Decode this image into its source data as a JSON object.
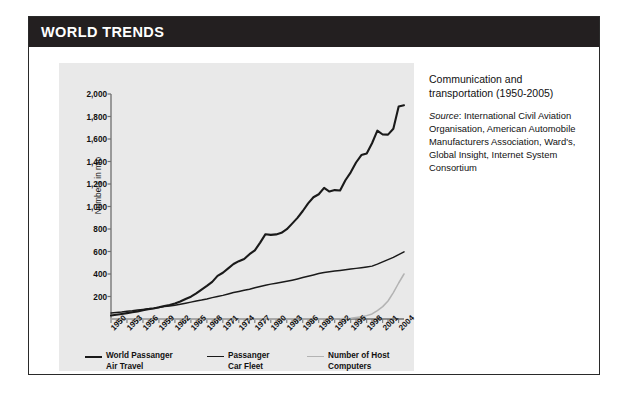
{
  "header": {
    "title": "WORLD TRENDS"
  },
  "caption": {
    "title": "Communication and transportation (1950-2005)",
    "source_label": "Source",
    "source_text": ": International Civil Aviation Organisation, American Automobile Manufacturers Association, Ward's, Global Insight, Internet System Consortium"
  },
  "colors": {
    "header_bg": "#231f20",
    "panel_bg": "#e9e9e9",
    "air_travel": "#1a1a1a",
    "car_fleet": "#1a1a1a",
    "host_computers": "#b3b3b3",
    "axis": "#6f6f6f",
    "text": "#111111"
  },
  "legend": [
    {
      "label": "World Passanger\nAir Travel",
      "color": "#1a1a1a",
      "width": 2.6,
      "left": 0
    },
    {
      "label": "Passanger\nCar Fleet",
      "color": "#1a1a1a",
      "width": 1.6,
      "left": 122
    },
    {
      "label": "Number of Host\nComputers",
      "color": "#b3b3b3",
      "width": 1.6,
      "left": 222
    }
  ],
  "chart_data": {
    "type": "line",
    "title": "Communication and transportation (1950-2005)",
    "xlabel": "",
    "ylabel": "Numbers in mio",
    "ylim": [
      0,
      2000
    ],
    "yticks": [
      200,
      400,
      600,
      800,
      1000,
      1200,
      1400,
      1600,
      1800,
      2000
    ],
    "ytick_labels": [
      "200",
      "400",
      "600",
      "800",
      "1,000",
      "1,200",
      "1,400",
      "1,600",
      "1,800",
      "2,000"
    ],
    "xlim": [
      1950,
      2005
    ],
    "xtick_labels": [
      "1950",
      "1953",
      "1956",
      "1959",
      "1962",
      "1965",
      "1968",
      "1971",
      "1974",
      "1977",
      "1980",
      "1983",
      "1986",
      "1989",
      "1992",
      "1995",
      "1998",
      "2001",
      "2004"
    ],
    "grid": false,
    "legend_position": "bottom",
    "x": [
      1950,
      1951,
      1952,
      1953,
      1954,
      1955,
      1956,
      1957,
      1958,
      1959,
      1960,
      1961,
      1962,
      1963,
      1964,
      1965,
      1966,
      1967,
      1968,
      1969,
      1970,
      1971,
      1972,
      1973,
      1974,
      1975,
      1976,
      1977,
      1978,
      1979,
      1980,
      1981,
      1982,
      1983,
      1984,
      1985,
      1986,
      1987,
      1988,
      1989,
      1990,
      1991,
      1992,
      1993,
      1994,
      1995,
      1996,
      1997,
      1998,
      1999,
      2000,
      2001,
      2002,
      2003,
      2004,
      2005
    ],
    "series": [
      {
        "name": "World Passanger Air Travel",
        "color": "#1a1a1a",
        "values": [
          31,
          38,
          45,
          52,
          60,
          68,
          78,
          88,
          94,
          104,
          116,
          125,
          138,
          155,
          178,
          198,
          228,
          262,
          294,
          330,
          383,
          411,
          450,
          489,
          514,
          534,
          576,
          610,
          679,
          754,
          748,
          752,
          766,
          798,
          848,
          899,
          960,
          1028,
          1082,
          1109,
          1165,
          1133,
          1146,
          1142,
          1233,
          1304,
          1391,
          1457,
          1471,
          1562,
          1674,
          1640,
          1639,
          1691,
          1889,
          1900
        ]
      },
      {
        "name": "Passanger Car Fleet",
        "color": "#1a1a1a",
        "values": [
          53,
          58,
          62,
          68,
          73,
          80,
          85,
          91,
          96,
          103,
          110,
          116,
          123,
          131,
          140,
          150,
          160,
          168,
          178,
          190,
          200,
          210,
          222,
          235,
          245,
          255,
          265,
          277,
          289,
          300,
          310,
          318,
          326,
          335,
          345,
          356,
          368,
          380,
          392,
          404,
          414,
          420,
          426,
          432,
          438,
          444,
          450,
          456,
          463,
          470,
          488,
          508,
          528,
          548,
          572,
          597
        ]
      },
      {
        "name": "Number of Host Computers",
        "color": "#b3b3b3",
        "values": [
          0,
          0,
          0,
          0,
          0,
          0,
          0,
          0,
          0,
          0,
          0,
          0,
          0,
          0,
          0,
          0,
          0,
          0,
          0,
          0,
          0,
          0,
          0,
          0,
          0,
          0,
          0,
          0,
          0,
          0,
          0,
          0,
          0,
          0,
          0,
          0,
          0,
          0,
          0,
          0,
          1,
          1,
          1,
          2,
          4,
          7,
          13,
          20,
          30,
          45,
          75,
          110,
          160,
          235,
          320,
          400
        ]
      }
    ]
  }
}
